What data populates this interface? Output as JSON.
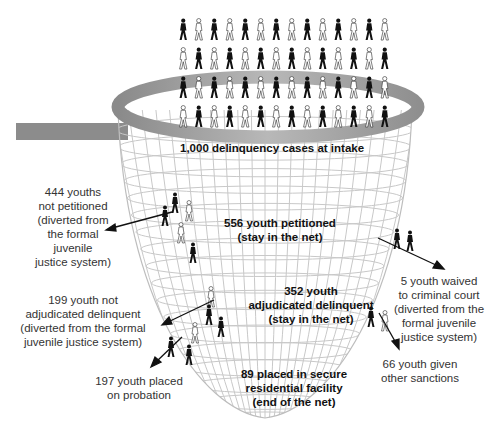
{
  "diagram": {
    "type": "juvenile-justice-funnel-net",
    "colors": {
      "rim": "#9a9a9a",
      "mesh": "#c8c8c8",
      "figure_dark": "#111111",
      "figure_light": "#ffffff",
      "arrow": "#111111",
      "text": "#333333"
    },
    "intake": {
      "lines": [
        "1,000 delinquency cases at intake"
      ]
    },
    "stages_in_net": [
      {
        "id": "petitioned",
        "lines": [
          "556 youth petitioned",
          "(stay in the net)"
        ]
      },
      {
        "id": "adjudicated",
        "lines": [
          "352 youth",
          "adjudicated delinquent",
          "(stay in the net)"
        ]
      },
      {
        "id": "secure",
        "lines": [
          "89 placed in secure",
          "residential facility",
          "(end of the net)"
        ]
      }
    ],
    "exits": [
      {
        "id": "not-petitioned",
        "lines": [
          "444 youths",
          "not petitioned",
          "(diverted from",
          "the formal",
          "juvenile",
          "justice system)"
        ]
      },
      {
        "id": "not-adjudicated",
        "lines": [
          "199 youth not",
          "adjudicated delinquent",
          "(diverted from the formal",
          "juvenile justice system)"
        ]
      },
      {
        "id": "probation",
        "lines": [
          "197 youth placed",
          "on probation"
        ]
      },
      {
        "id": "waived",
        "lines": [
          "5 youth waived",
          "to criminal court",
          "(diverted from the",
          "formal juvenile",
          "justice system)"
        ]
      },
      {
        "id": "other-sanctions",
        "lines": [
          "66 youth given",
          "other sanctions"
        ]
      }
    ]
  }
}
